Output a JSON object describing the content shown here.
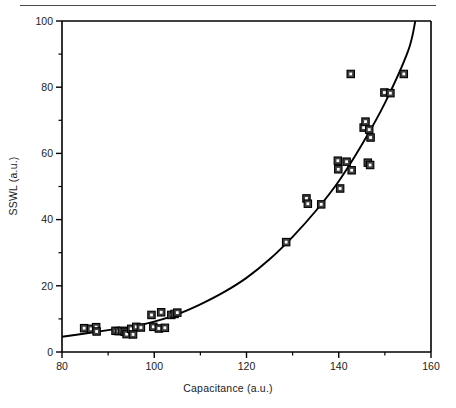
{
  "figure": {
    "top_rule": "horizontal-rule",
    "background_color": "#ffffff",
    "line_color": "#000000",
    "marker_fill": "#3a3a3a",
    "marker_inner": "#ffffff"
  },
  "chart_data": {
    "type": "scatter",
    "title": "",
    "xlabel": "Capacitance (a.u.)",
    "ylabel": "SSWL (a.u.)",
    "xlim": [
      80,
      160
    ],
    "ylim": [
      0,
      100
    ],
    "xticks": [
      80,
      100,
      120,
      140,
      160
    ],
    "yticks": [
      0,
      20,
      40,
      60,
      80,
      100
    ],
    "xticklabels": [
      "80",
      "100",
      "120",
      "140",
      "160"
    ],
    "yticklabels": [
      "0",
      "20",
      "40",
      "60",
      "80",
      "100"
    ],
    "x_minor_ticks": [
      90,
      110,
      130,
      150
    ],
    "y_minor_ticks": [
      10,
      30,
      50,
      70,
      90
    ],
    "grid": false,
    "legend": null,
    "series": [
      {
        "name": "measurements",
        "marker": "open-square-in-filled-square",
        "points": [
          [
            84.8,
            7.2
          ],
          [
            86.3,
            7.0
          ],
          [
            87.4,
            7.5
          ],
          [
            87.5,
            6.2
          ],
          [
            91.6,
            6.4
          ],
          [
            92.3,
            6.3
          ],
          [
            93.0,
            6.4
          ],
          [
            93.6,
            6.1
          ],
          [
            94.0,
            5.4
          ],
          [
            95.0,
            7.0
          ],
          [
            95.4,
            5.3
          ],
          [
            96.1,
            7.6
          ],
          [
            97.1,
            7.4
          ],
          [
            99.4,
            11.2
          ],
          [
            99.8,
            7.6
          ],
          [
            101.0,
            7.1
          ],
          [
            101.5,
            12.0
          ],
          [
            102.3,
            7.3
          ],
          [
            103.7,
            11.2
          ],
          [
            104.4,
            11.5
          ],
          [
            105.0,
            11.9
          ],
          [
            128.6,
            33.2
          ],
          [
            133.0,
            46.4
          ],
          [
            133.3,
            44.8
          ],
          [
            136.2,
            44.6
          ],
          [
            139.8,
            57.8
          ],
          [
            139.9,
            55.2
          ],
          [
            140.3,
            49.4
          ],
          [
            141.7,
            57.5
          ],
          [
            142.6,
            84.0
          ],
          [
            142.8,
            54.9
          ],
          [
            145.4,
            67.8
          ],
          [
            145.8,
            69.6
          ],
          [
            146.3,
            57.2
          ],
          [
            146.6,
            67.2
          ],
          [
            146.8,
            56.5
          ],
          [
            146.9,
            64.8
          ],
          [
            149.9,
            78.4
          ],
          [
            151.2,
            78.2
          ],
          [
            154.1,
            84.0
          ]
        ]
      }
    ],
    "fit_curve": {
      "name": "exponential-fit",
      "description": "smooth monotonic exponential trend line",
      "points": [
        [
          80,
          4.6
        ],
        [
          85,
          5.6
        ],
        [
          90,
          6.6
        ],
        [
          95,
          7.6
        ],
        [
          100,
          9.2
        ],
        [
          105,
          11.4
        ],
        [
          110,
          14.4
        ],
        [
          115,
          18.0
        ],
        [
          120,
          22.4
        ],
        [
          125,
          28.0
        ],
        [
          130,
          34.8
        ],
        [
          135,
          42.6
        ],
        [
          140,
          51.6
        ],
        [
          145,
          62.6
        ],
        [
          150,
          75.2
        ],
        [
          155,
          90.8
        ],
        [
          156.6,
          100.0
        ]
      ]
    }
  }
}
